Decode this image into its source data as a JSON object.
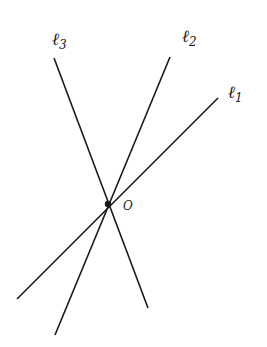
{
  "diagram": {
    "lines": [
      {
        "id": "l1",
        "label": "ℓ",
        "subscript": "1",
        "x1": 17,
        "y1": 299,
        "x2": 218,
        "y2": 98,
        "label_x": 228,
        "label_y": 98
      },
      {
        "id": "l2",
        "label": "ℓ",
        "subscript": "2",
        "x1": 55,
        "y1": 335,
        "x2": 170,
        "y2": 57,
        "label_x": 182,
        "label_y": 42
      },
      {
        "id": "l3",
        "label": "ℓ",
        "subscript": "3",
        "x1": 54,
        "y1": 58,
        "x2": 148,
        "y2": 308,
        "label_x": 52,
        "label_y": 45
      }
    ],
    "point": {
      "label": "O",
      "x": 108,
      "y": 204,
      "label_x": 123,
      "label_y": 210
    },
    "colors": {
      "stroke": "#1a1a1a",
      "background": "#ffffff"
    }
  }
}
